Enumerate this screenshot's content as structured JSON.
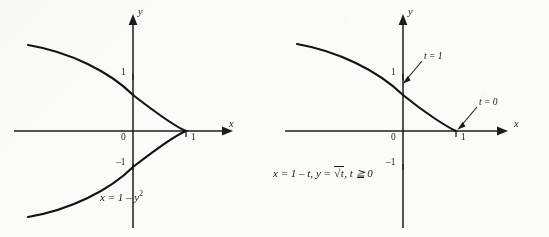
{
  "figure": {
    "background_color": "#fbfbfa",
    "ink_color": "#1a1a1a",
    "panels": [
      {
        "id": "left",
        "name": "cartesian-parabola",
        "caption": "x = 1 – y",
        "caption_exponent": "2",
        "axes": {
          "x_label": "x",
          "y_label": "y",
          "origin_label": "0",
          "x_ticks": [
            "1"
          ],
          "y_ticks": [
            "1",
            "–1"
          ]
        },
        "curve": {
          "equation": "x = 1 - y^2",
          "vertex": "(1, 0)",
          "opens": "left",
          "branches": "both"
        }
      },
      {
        "id": "right",
        "name": "parametric-curve",
        "caption_parts": {
          "x_part": "x = 1 – t,",
          "y_part": "y =",
          "radical_var": "t",
          "domain_part": ", t ≧ 0"
        },
        "axes": {
          "x_label": "x",
          "y_label": "y",
          "origin_label": "0",
          "x_ticks": [
            "1"
          ],
          "y_ticks": [
            "1",
            "–1"
          ]
        },
        "curve": {
          "equation": "x = 1 - t, y = sqrt(t), t >= 0",
          "opens": "left",
          "branches": "upper only"
        },
        "annotations": [
          {
            "label": "t = 1",
            "points_to": "(0, 1)"
          },
          {
            "label": "t = 0",
            "points_to": "(1, 0)"
          }
        ]
      }
    ]
  }
}
